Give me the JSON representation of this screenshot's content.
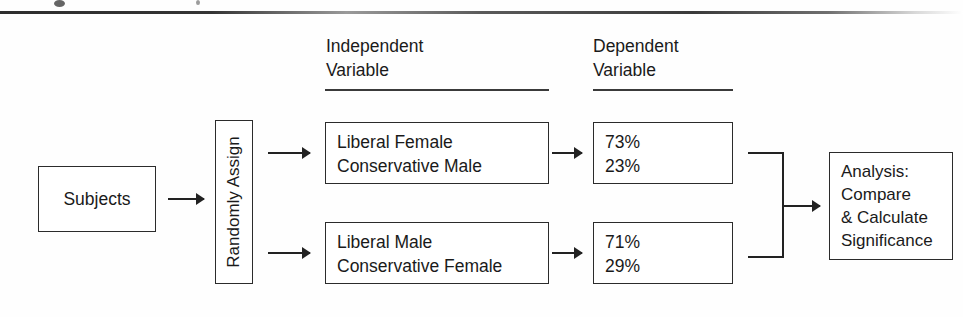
{
  "figure": {
    "type": "experimental-design-flowchart",
    "headers": {
      "independent_variable": "Independent\nVariable",
      "dependent_variable": "Dependent\nVariable"
    },
    "start_node": {
      "label": "Subjects"
    },
    "assignment_node": {
      "label": "Randomly Assign",
      "orientation": "vertical-rotated-90ccw"
    },
    "conditions": [
      {
        "label": "Liberal Female\nConservative Male"
      },
      {
        "label": "Liberal Male\nConservative Female"
      }
    ],
    "results": [
      {
        "label": "73%\n23%",
        "values": [
          73,
          23
        ]
      },
      {
        "label": "71%\n29%",
        "values": [
          71,
          29
        ]
      }
    ],
    "analysis_node": {
      "label": "Analysis:\nCompare\n& Calculate\nSignificance"
    },
    "colors": {
      "stroke": "#2b2b2b",
      "text": "#1a1a1a",
      "background": "#ffffff"
    }
  }
}
